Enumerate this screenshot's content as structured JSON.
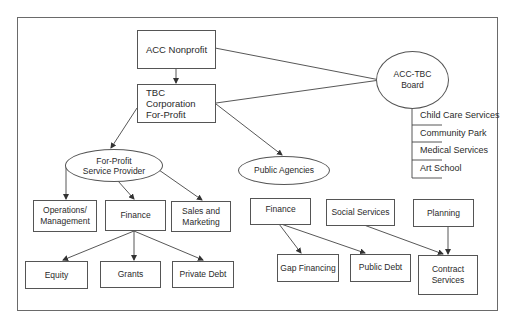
{
  "diagram": {
    "nodes": {
      "acc_nonprofit": "ACC Nonprofit",
      "tbc_corporation": "TBC Corporation\nFor-Profit",
      "board": "ACC-TBC\nBoard",
      "for_profit_provider": "For-Profit\nService Provider",
      "public_agencies": "Public Agencies",
      "operations": "Operations/\nManagement",
      "fp_finance": "Finance",
      "sales_marketing": "Sales and\nMarketing",
      "equity": "Equity",
      "grants": "Grants",
      "private_debt": "Private Debt",
      "pa_finance": "Finance",
      "social_services": "Social Services",
      "planning": "Planning",
      "gap_financing": "Gap Financing",
      "public_debt": "Public Debt",
      "contract_services": "Contract\nServices"
    },
    "board_list": [
      "Child Care Services",
      "Community Park",
      "Medical Services",
      "Art School"
    ],
    "edges": [
      {
        "from": "acc_nonprofit",
        "to": "tbc_corporation",
        "arrow": true
      },
      {
        "from": "acc_nonprofit",
        "to": "board",
        "arrow": false
      },
      {
        "from": "tbc_corporation",
        "to": "board",
        "arrow": false
      },
      {
        "from": "tbc_corporation",
        "to": "for_profit_provider",
        "arrow": true
      },
      {
        "from": "tbc_corporation",
        "to": "public_agencies",
        "arrow": true
      },
      {
        "from": "for_profit_provider",
        "to": "operations",
        "arrow": true
      },
      {
        "from": "for_profit_provider",
        "to": "fp_finance",
        "arrow": true
      },
      {
        "from": "for_profit_provider",
        "to": "sales_marketing",
        "arrow": true
      },
      {
        "from": "fp_finance",
        "to": "equity",
        "arrow": true
      },
      {
        "from": "fp_finance",
        "to": "grants",
        "arrow": true
      },
      {
        "from": "fp_finance",
        "to": "private_debt",
        "arrow": true
      },
      {
        "from": "pa_finance",
        "to": "gap_financing",
        "arrow": true
      },
      {
        "from": "pa_finance",
        "to": "public_debt",
        "arrow": true
      },
      {
        "from": "social_services",
        "to": "contract_services",
        "arrow": true
      },
      {
        "from": "planning",
        "to": "contract_services",
        "arrow": true
      }
    ],
    "colors": {
      "line": "#444444",
      "border": "#555555",
      "text": "#2a2a2a",
      "background": "#ffffff"
    }
  }
}
